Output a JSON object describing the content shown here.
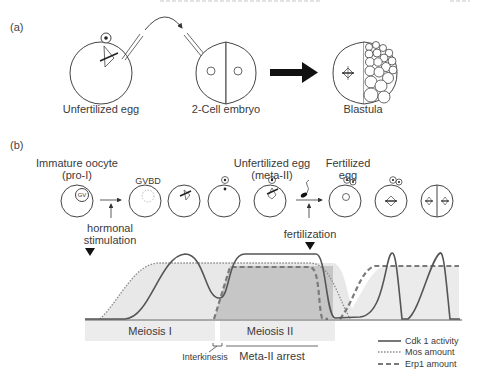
{
  "header": {
    "running_title": "",
    "page_number": ""
  },
  "panel_a": {
    "label": "(a)",
    "stages": [
      {
        "name": "Unfertilized egg"
      },
      {
        "name": "2-Cell embryo"
      },
      {
        "name": "Blastula"
      }
    ]
  },
  "panel_b": {
    "label": "(b)",
    "top_labels": {
      "immature_oocyte_line1": "Immature oocyte",
      "immature_oocyte_line2": "(pro-I)",
      "gvbd": "GVBD",
      "gv": "GV",
      "unfertilized_line1": "Unfertilized egg",
      "unfertilized_line2": "(meta-II)",
      "fertilized_line1": "Fertilized",
      "fertilized_line2": "egg"
    },
    "events": {
      "hormonal_line1": "hormonal",
      "hormonal_line2": "stimulation",
      "fertilization": "fertilization"
    },
    "phases": {
      "meiosis_1": "Meiosis I",
      "meiosis_2": "Meiosis II",
      "interkinesis": "Interkinesis",
      "meta_2_arrest": "Meta-II arrest"
    },
    "legend": [
      {
        "label": "Cdk 1 activity",
        "style": "solid",
        "color": "#555555"
      },
      {
        "label": "Mos amount",
        "style": "dotted",
        "color": "#888888"
      },
      {
        "label": "Erp1 amount",
        "style": "dashed",
        "color": "#777777"
      }
    ]
  },
  "colors": {
    "line": "#444444",
    "light_fill": "#e6e6e6",
    "dark_fill": "#c4c4c4",
    "band_fill": "#ececec"
  }
}
